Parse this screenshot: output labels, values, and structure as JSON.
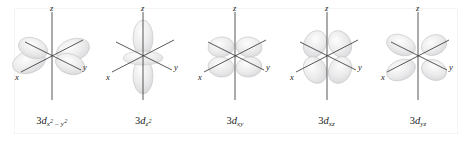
{
  "figure": {
    "type": "orbital-diagram-row",
    "background_color": "#ffffff",
    "frame_color": "#f4f4f4",
    "lobe_fill": "#e9e9ea",
    "lobe_stroke": "#c9c9cc",
    "axis_color": "#3a3a3a",
    "label_color": "#1b1b1b",
    "count": 5
  },
  "axes": {
    "z_label": "z",
    "y_label": "y",
    "x_label": "x"
  },
  "orbitals": [
    {
      "id": "3d-x2-y2",
      "shell": "3",
      "type": "d",
      "subscript_text": "x2 - y2",
      "label_plain": "3dx2 - y2",
      "sub_main_1": "x",
      "sub_sup_1": "2",
      "sub_minus": " – ",
      "sub_main_2": "y",
      "sub_sup_2": "2",
      "shape": "four-lobe-on-axes",
      "lobe_count": 4,
      "lobes_along": "x and y axes"
    },
    {
      "id": "3d-z2",
      "shell": "3",
      "type": "d",
      "subscript_text": "z2",
      "label_plain": "3dz2",
      "sub_main_1": "z",
      "sub_sup_1": "2",
      "sub_minus": "",
      "sub_main_2": "",
      "sub_sup_2": "",
      "shape": "two-lobe-with-torus",
      "lobe_count": 2,
      "lobes_along": "z axis with equatorial torus"
    },
    {
      "id": "3d-xy",
      "shell": "3",
      "type": "d",
      "subscript_text": "xy",
      "label_plain": "3dxy",
      "sub_main_1": "xy",
      "sub_sup_1": "",
      "sub_minus": "",
      "sub_main_2": "",
      "sub_sup_2": "",
      "shape": "four-lobe-between-axes",
      "lobe_count": 4,
      "lobes_along": "between x and y axes"
    },
    {
      "id": "3d-xz",
      "shell": "3",
      "type": "d",
      "subscript_text": "xz",
      "label_plain": "3dxz",
      "sub_main_1": "xz",
      "sub_sup_1": "",
      "sub_minus": "",
      "sub_main_2": "",
      "sub_sup_2": "",
      "shape": "four-lobe-between-axes",
      "lobe_count": 4,
      "lobes_along": "between x and z axes"
    },
    {
      "id": "3d-yz",
      "shell": "3",
      "type": "d",
      "subscript_text": "yz",
      "label_plain": "3dyz",
      "sub_main_1": "yz",
      "sub_sup_1": "",
      "sub_minus": "",
      "sub_main_2": "",
      "sub_sup_2": "",
      "shape": "four-lobe-between-axes",
      "lobe_count": 4,
      "lobes_along": "between y and z axes"
    }
  ]
}
